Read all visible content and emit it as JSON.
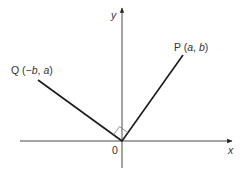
{
  "diagram": {
    "type": "coordinate-geometry",
    "axes": {
      "x_label": "x",
      "y_label": "y",
      "origin_label": "0"
    },
    "points": [
      {
        "name": "P",
        "coords_label": "(a, b)",
        "pre": "P (",
        "v1": "a",
        "sep": ", ",
        "v2": "b",
        "post": ")"
      },
      {
        "name": "Q",
        "coords_label": "(−b, a)",
        "pre": "Q (−",
        "v1": "b",
        "sep": ", ",
        "v2": "a",
        "post": ")"
      }
    ],
    "annotations": [
      "right angle at origin between OP and OQ"
    ],
    "colors": {
      "line": "#1a1a1a",
      "axis": "#333333",
      "marker": "#666666"
    }
  }
}
